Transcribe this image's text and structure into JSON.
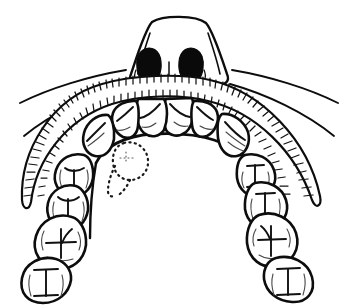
{
  "figure": {
    "style": "black-and-white pen-and-ink line drawing",
    "background_color": "#ffffff",
    "ink_color": "#0d0d0d",
    "width": 358,
    "height": 305
  },
  "anatomy": {
    "nose": {
      "label": "nose",
      "nostrils": [
        {
          "label": "left-nostril",
          "fill": "#0a0a0a"
        },
        {
          "label": "right-nostril",
          "fill": "#0a0a0a"
        }
      ]
    },
    "lip_lines": [
      {
        "label": "upper-lip-line-left"
      },
      {
        "label": "upper-lip-line-right"
      },
      {
        "label": "cheek-fold-line-left"
      },
      {
        "label": "cheek-fold-line-right"
      }
    ],
    "gingiva": {
      "label": "gingival tissue band",
      "hatching": "short radial strokes",
      "stroke_count": 96
    },
    "palate": {
      "label": "hard palate",
      "fill": "#ffffff"
    }
  },
  "annotation": {
    "extraction_site": {
      "label": "missing tooth outline",
      "style": "dotted",
      "position": "left lateral incisor / canine region"
    }
  },
  "teeth": {
    "count": 14,
    "arch": "maxillary",
    "view": "occlusal",
    "items": [
      {
        "id": "t11",
        "name": "central incisor right",
        "type": "incisor",
        "quadrant": "right"
      },
      {
        "id": "t21",
        "name": "central incisor left",
        "type": "incisor",
        "quadrant": "left"
      },
      {
        "id": "t12",
        "name": "lateral incisor right",
        "type": "incisor",
        "quadrant": "right"
      },
      {
        "id": "t22",
        "name": "lateral incisor left",
        "type": "incisor",
        "quadrant": "left"
      },
      {
        "id": "t13",
        "name": "canine right",
        "type": "canine",
        "quadrant": "right"
      },
      {
        "id": "t23",
        "name": "canine left",
        "type": "canine",
        "quadrant": "left"
      },
      {
        "id": "t14",
        "name": "first premolar right",
        "type": "premolar",
        "quadrant": "right"
      },
      {
        "id": "t24",
        "name": "first premolar left",
        "type": "premolar",
        "quadrant": "left"
      },
      {
        "id": "t15",
        "name": "second premolar right",
        "type": "premolar",
        "quadrant": "right"
      },
      {
        "id": "t25",
        "name": "second premolar left",
        "type": "premolar",
        "quadrant": "left"
      },
      {
        "id": "t16",
        "name": "first molar right",
        "type": "molar",
        "quadrant": "right"
      },
      {
        "id": "t26",
        "name": "first molar left",
        "type": "molar",
        "quadrant": "left"
      },
      {
        "id": "t17",
        "name": "second molar right",
        "type": "molar",
        "quadrant": "right"
      },
      {
        "id": "t27",
        "name": "second molar left",
        "type": "molar",
        "quadrant": "left"
      }
    ]
  }
}
